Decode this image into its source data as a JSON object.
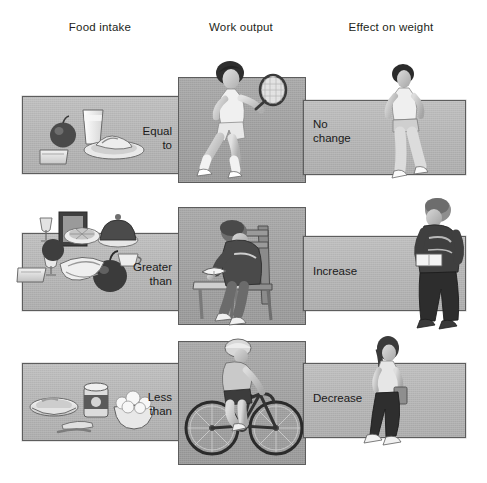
{
  "diagram": {
    "title_row_headers": [
      "Food intake",
      "Work output",
      "Effect on weight"
    ],
    "headers": {
      "food_intake": "Food intake",
      "work_output": "Work output",
      "effect_on_weight": "Effect on weight"
    },
    "rows": [
      {
        "id": "row-equal",
        "comparison_label": "Equal\nto",
        "effect_label": "No\nchange",
        "food_scene": "plate of food with apple, glass of milk, bread slice",
        "work_scene": "woman playing tennis with racket",
        "effect_scene": "woman standing, no weight change"
      },
      {
        "id": "row-greater",
        "comparison_label": "Greater\nthan",
        "effect_label": "Increase",
        "food_scene": "large spread of food, cake, turkey, apple, pastries, drinks",
        "work_scene": "man sitting at desk reading a book",
        "effect_scene": "heavier man standing holding a book"
      },
      {
        "id": "row-less",
        "comparison_label": "Less\nthan",
        "effect_label": "Decrease",
        "food_scene": "small bowl of soup, can, bowl of popcorn, utensils",
        "work_scene": "person riding a bicycle",
        "effect_scene": "slim woman walking"
      }
    ],
    "colors": {
      "bar_fill": "#b5b5b5",
      "square_fill": "#9e9e9e",
      "border": "#5d5d5d",
      "text": "#1a1a1a",
      "background": "#ffffff"
    }
  }
}
